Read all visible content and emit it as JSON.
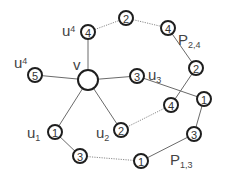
{
  "diagram": {
    "center": {
      "id": "v",
      "label": "v",
      "x": 88,
      "y": 80,
      "r": 11
    },
    "nodes": [
      {
        "id": "u4a",
        "weight": "4",
        "x": 88,
        "y": 32
      },
      {
        "id": "u4b",
        "weight": "5",
        "x": 35,
        "y": 75
      },
      {
        "id": "u3",
        "weight": "3",
        "x": 137,
        "y": 76
      },
      {
        "id": "u2",
        "weight": "2",
        "x": 121,
        "y": 130
      },
      {
        "id": "u1",
        "weight": "1",
        "x": 55,
        "y": 132
      },
      {
        "id": "p24a",
        "weight": "2",
        "x": 126,
        "y": 18
      },
      {
        "id": "p24b",
        "weight": "4",
        "x": 168,
        "y": 28
      },
      {
        "id": "p24c",
        "weight": "2",
        "x": 196,
        "y": 68
      },
      {
        "id": "p24d",
        "weight": "4",
        "x": 171,
        "y": 105
      },
      {
        "id": "p13a",
        "weight": "3",
        "x": 80,
        "y": 156
      },
      {
        "id": "p13b",
        "weight": "1",
        "x": 141,
        "y": 161
      },
      {
        "id": "p13c",
        "weight": "3",
        "x": 194,
        "y": 134
      },
      {
        "id": "p13d",
        "weight": "1",
        "x": 204,
        "y": 99
      }
    ],
    "labels": {
      "u4_top": "u",
      "u4_top_sub": "4",
      "u4_left": "u",
      "u4_left_sub": "4",
      "v": "v",
      "u3": "u",
      "u3_sub": "3",
      "u2": "u",
      "u2_sub": "2",
      "u1": "u",
      "u1_sub": "1",
      "p24": "P",
      "p24_sub": "2,4",
      "p13": "P",
      "p13_sub": "1,3"
    }
  }
}
